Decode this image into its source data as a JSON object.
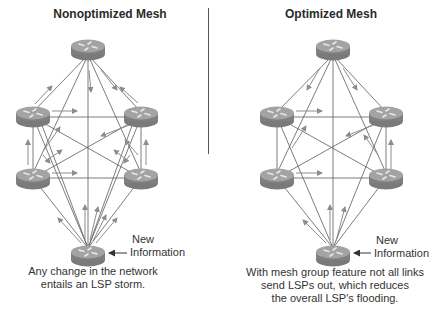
{
  "left_panel": {
    "title": "Nonoptimized Mesh",
    "new_info_label": [
      "New",
      "Information"
    ],
    "caption": [
      "Any change in the network",
      "entails an LSP storm."
    ]
  },
  "right_panel": {
    "title": "Optimized Mesh",
    "new_info_label": [
      "New",
      "Information"
    ],
    "caption": [
      "With mesh group feature not all links",
      "send LSPs out, which reduces",
      "the overall LSP's flooding."
    ]
  },
  "colors": {
    "router_body": "#8a8a8a",
    "router_top": "#a5a5a5",
    "link_line": "#555555",
    "arrow": "#8c8c8c",
    "divider": "#555555"
  },
  "icons": {
    "router": "router-icon",
    "arrow": "arrow-icon"
  }
}
